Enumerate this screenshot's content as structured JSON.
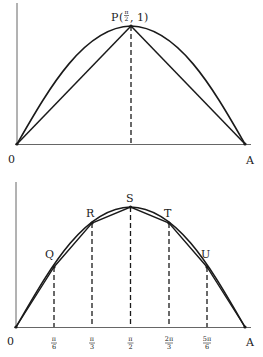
{
  "colors": {
    "stroke": "#1a1a1a",
    "axis": "#555555",
    "background": "#ffffff"
  },
  "top_figure": {
    "origin_label": "0",
    "end_label": "A",
    "peak_label": "P",
    "peak_coord_num": "π",
    "peak_coord_den": "2",
    "peak_coord_y": "1",
    "description": "Graph of y = sin x on [0, π] with chords OP and PA and a dashed vertical line from P to the x-axis"
  },
  "bottom_figure": {
    "origin_label": "0",
    "end_label": "A",
    "points": [
      {
        "name": "Q",
        "x_num": "π",
        "x_den": "6"
      },
      {
        "name": "R",
        "x_num": "π",
        "x_den": "3"
      },
      {
        "name": "S",
        "x_num": "π",
        "x_den": "2"
      },
      {
        "name": "T",
        "x_num": "2π",
        "x_den": "3"
      },
      {
        "name": "U",
        "x_num": "5π",
        "x_den": "6"
      }
    ],
    "description": "Graph of y = sin x on [0, π] approximated by polygonal chords through points Q, R, S, T, U with dashed verticals at multiples of π/6"
  }
}
